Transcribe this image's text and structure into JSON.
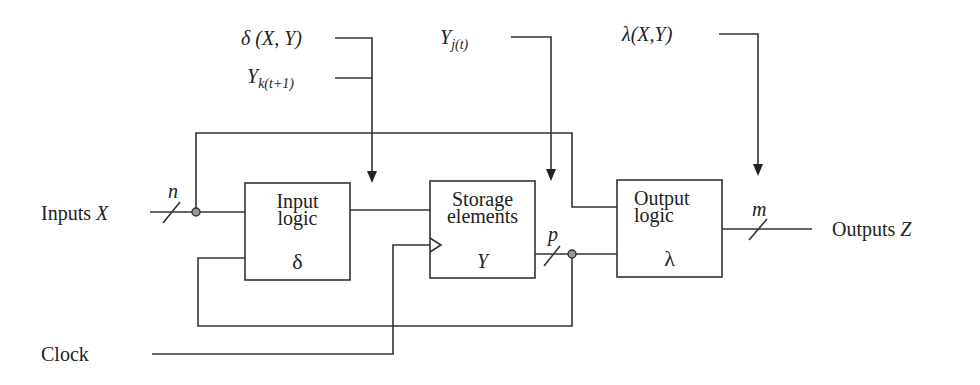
{
  "diagram": {
    "type": "sequential-circuit-block-diagram",
    "signals": {
      "inputs": {
        "label_prefix": "Inputs ",
        "label_var": "X",
        "bus_width": "n"
      },
      "outputs": {
        "label_prefix": "Outputs ",
        "label_var": "Z",
        "bus_width": "m"
      },
      "clock": {
        "label": "Clock"
      },
      "state_bus_width": "p"
    },
    "blocks": [
      {
        "id": "input-logic",
        "line1": "Input",
        "line2": "logic",
        "symbol": "δ"
      },
      {
        "id": "storage-elements",
        "line1": "Storage",
        "line2": "elements",
        "symbol": "Y"
      },
      {
        "id": "output-logic",
        "line1": "Output",
        "line2": "logic",
        "symbol": "λ"
      }
    ],
    "annotations": {
      "next_state_func": "δ (X, Y)",
      "next_state_var_base": "Y",
      "next_state_var_sub": "k(t+1)",
      "present_state_base": "Y",
      "present_state_sub": "j(t)",
      "output_func": "λ(X,Y)"
    }
  }
}
